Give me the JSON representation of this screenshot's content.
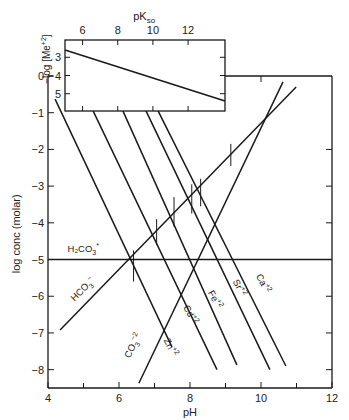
{
  "chart_data": {
    "type": "line",
    "title": "",
    "main": {
      "xlabel": "pH",
      "ylabel": "log conc (molar)",
      "xlim": [
        4,
        12
      ],
      "ylim": [
        -8.5,
        0
      ],
      "x_ticks": [
        4,
        6,
        8,
        10,
        12
      ],
      "x_minor_ticks": [
        5,
        7,
        9,
        11
      ],
      "y_ticks": [
        0,
        -1,
        -2,
        -3,
        -4,
        -5,
        -6,
        -7,
        -8
      ],
      "y_tick_labels": [
        "0",
        "−1",
        "−2",
        "−3",
        "−4",
        "−5",
        "−6",
        "−7",
        "−8"
      ],
      "grid": false,
      "series": [
        {
          "name": "Zn+2",
          "label": "Zn",
          "charge": "+2",
          "points": [
            [
              4.2,
              -0.63
            ],
            [
              7.49,
              -7.38
            ]
          ],
          "label_pos": [
            7.25,
            -7.2
          ],
          "label_rot": 62
        },
        {
          "name": "Cd+2",
          "label": "Cd",
          "charge": "+2",
          "points": [
            [
              5.27,
              -0.95
            ],
            [
              8.76,
              -8.0
            ]
          ],
          "label_pos": [
            7.8,
            -6.3
          ],
          "label_rot": 62
        },
        {
          "name": "Fe+2",
          "label": "Fe",
          "charge": "+2",
          "points": [
            [
              6.11,
              -0.95
            ],
            [
              9.32,
              -7.87
            ]
          ],
          "label_pos": [
            8.5,
            -5.9
          ],
          "label_rot": 62
        },
        {
          "name": "Sr+2",
          "label": "Sr",
          "charge": "+2",
          "points": [
            [
              6.76,
              -0.95
            ],
            [
              10.25,
              -8.0
            ]
          ],
          "label_pos": [
            9.2,
            -5.6
          ],
          "label_rot": 62
        },
        {
          "name": "Ca+2",
          "label": "Ca",
          "charge": "+2",
          "points": [
            [
              7.1,
              -0.95
            ],
            [
              10.7,
              -7.9
            ]
          ],
          "label_pos": [
            9.85,
            -5.45
          ],
          "label_rot": 62
        },
        {
          "name": "HCO3-",
          "label": "HCO",
          "sub": "3",
          "charge": "−",
          "points": [
            [
              4.34,
              -6.92
            ],
            [
              10.99,
              -0.3
            ]
          ],
          "label_pos": [
            4.75,
            -6.15
          ],
          "label_rot": -45
        },
        {
          "name": "CO3-2",
          "label": "CO",
          "sub": "3",
          "charge": "−2",
          "points": [
            [
              6.56,
              -8.37
            ],
            [
              10.62,
              -0.16
            ]
          ],
          "label_pos": [
            6.3,
            -7.7
          ],
          "label_rot": -63
        },
        {
          "name": "H2CO3*",
          "label": "H₂CO",
          "sub": "3",
          "charge": "*",
          "points": [
            [
              4.0,
              -5.0
            ],
            [
              12.0,
              -5.0
            ]
          ],
          "label_pos": [
            4.55,
            -4.8
          ],
          "label_rot": 0
        }
      ],
      "markers": [
        {
          "x": 6.41,
          "y_range": [
            -4.75,
            -5.6
          ]
        },
        {
          "x": 7.06,
          "y_range": [
            -3.9,
            -4.6
          ]
        },
        {
          "x": 7.55,
          "y_range": [
            -3.3,
            -4.1
          ]
        },
        {
          "x": 8.05,
          "y_range": [
            -2.95,
            -3.75
          ]
        },
        {
          "x": 8.3,
          "y_range": [
            -2.8,
            -3.55
          ]
        },
        {
          "x": 9.15,
          "y_range": [
            -1.85,
            -2.45
          ]
        }
      ]
    },
    "inset": {
      "xlabel": "pK",
      "xlabel_sub": "so",
      "ylabel": "−log [Me",
      "ylabel_sup": "+2",
      "ylabel_end": "]",
      "xlim": [
        5,
        14.1
      ],
      "ylim": [
        5.95,
        2.05
      ],
      "x_ticks": [
        6,
        8,
        10,
        12
      ],
      "y_ticks": [
        3,
        4,
        5
      ],
      "series": [
        {
          "name": "solubility-line",
          "points": [
            [
              5.0,
              2.6
            ],
            [
              14.1,
              5.4
            ]
          ]
        }
      ]
    }
  }
}
